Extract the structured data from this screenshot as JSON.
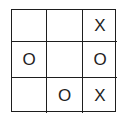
{
  "game": {
    "type": "tic-tac-toe",
    "board": [
      [
        "",
        "",
        "X"
      ],
      [
        "O",
        "",
        "O"
      ],
      [
        "",
        "O",
        "X"
      ]
    ]
  }
}
